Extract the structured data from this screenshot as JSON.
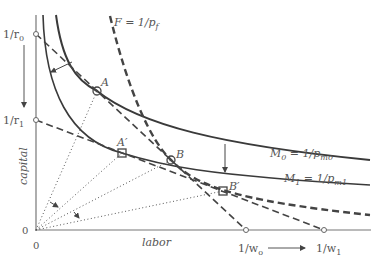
{
  "diagram": {
    "axes": {
      "x_label": "labor",
      "y_label": "capital",
      "origin_x": "0",
      "origin_y": "0"
    },
    "y_ticks": [
      {
        "label": "1/r",
        "sub": "0"
      },
      {
        "label": "1/r",
        "sub": "1"
      }
    ],
    "x_ticks": [
      {
        "label": "1/w",
        "sub": "o"
      },
      {
        "label": "1/w",
        "sub": "1"
      }
    ],
    "curves": {
      "F": {
        "label": "F = 1/p",
        "sub": "f"
      },
      "M0": {
        "label": "M",
        "sub0": "0",
        "mid": " = 1/p",
        "sub1": "m0"
      },
      "M1": {
        "label": "M",
        "sub0": "1",
        "mid": " = 1/p",
        "sub1": "m1"
      }
    },
    "points": {
      "A": "A",
      "A_prime": "A′",
      "B": "B",
      "B_prime": "B′"
    },
    "colors": {
      "line": "#444444",
      "text": "#555555",
      "background": "#ffffff"
    }
  }
}
